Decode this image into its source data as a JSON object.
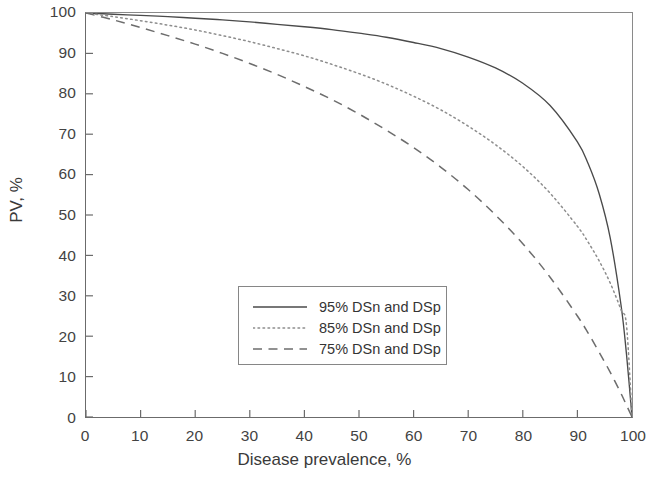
{
  "chart_data": {
    "type": "line",
    "title": "",
    "xlabel": "Disease prevalence, %",
    "ylabel": "PV, %",
    "xlim": [
      0,
      100
    ],
    "ylim": [
      0,
      100
    ],
    "grid": false,
    "legend_position": "center",
    "xticks": [
      "0",
      "10",
      "20",
      "30",
      "40",
      "50",
      "60",
      "70",
      "80",
      "90",
      "100"
    ],
    "yticks": [
      "0",
      "10",
      "20",
      "30",
      "40",
      "50",
      "60",
      "70",
      "80",
      "90",
      "100"
    ],
    "x": [
      0,
      5,
      10,
      15,
      20,
      25,
      30,
      35,
      40,
      45,
      50,
      55,
      60,
      65,
      70,
      75,
      80,
      85,
      90,
      92,
      94,
      96,
      98,
      99,
      100
    ],
    "series": [
      {
        "name": "95% DSn and DSp",
        "style": "solid",
        "color": "#4a4a4a",
        "values": [
          100,
          99.7,
          99.4,
          99.1,
          98.7,
          98.3,
          97.8,
          97.2,
          96.6,
          95.9,
          95.0,
          94.0,
          92.7,
          91.2,
          89.1,
          86.4,
          82.6,
          77.1,
          68.1,
          62.6,
          55.2,
          44.4,
          27.6,
          15.4,
          0
        ]
      },
      {
        "name": "85% DSn and DSp",
        "style": "dotted",
        "color": "#8d8d8d",
        "values": [
          100,
          99.1,
          98.1,
          97.0,
          95.8,
          94.4,
          92.9,
          91.2,
          89.4,
          87.3,
          85.0,
          82.4,
          79.4,
          76.0,
          72.0,
          67.4,
          62.0,
          55.4,
          47.2,
          43.2,
          38.6,
          33.2,
          26.5,
          22.6,
          0
        ]
      },
      {
        "name": "75% DSn and DSp",
        "style": "dashed",
        "color": "#6d6d6d",
        "values": [
          100,
          98.3,
          96.4,
          94.4,
          92.3,
          90.0,
          87.5,
          84.8,
          81.8,
          78.6,
          75.0,
          71.0,
          66.7,
          61.8,
          56.3,
          50.0,
          42.9,
          34.6,
          25.0,
          20.7,
          16.0,
          11.1,
          5.8,
          2.9,
          0
        ]
      }
    ]
  },
  "axes": {
    "x_title": "Disease prevalence, %",
    "y_title": "PV, %"
  }
}
